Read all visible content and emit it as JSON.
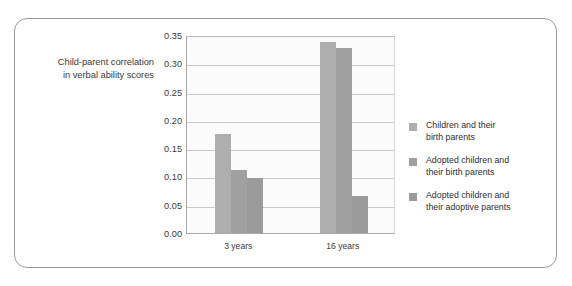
{
  "figure": {
    "background": "#ffffff",
    "frame_color": "#9a9a9a"
  },
  "chart_data": {
    "type": "bar",
    "title": "",
    "xlabel": "",
    "ylabel": "Child-parent correlation in verbal ability scores",
    "ylabel_line1": "Child-parent correlation",
    "ylabel_line2": "in verbal ability scores",
    "categories": [
      "3 years",
      "16 years"
    ],
    "ylim": [
      0.0,
      0.35
    ],
    "ytick_labels": [
      "0.35",
      "0.30",
      "0.25",
      "0.20",
      "0.15",
      "0.10",
      "0.05",
      "0.00"
    ],
    "ytick_values": [
      0.35,
      0.3,
      0.25,
      0.2,
      0.15,
      0.1,
      0.05,
      0.0
    ],
    "grid": true,
    "grid_axis": "y",
    "legend_position": "right",
    "series": [
      {
        "name": "Children and their birth parents",
        "name_line1": "Children and their",
        "name_line2": "birth parents",
        "color": "#aeaeae",
        "values": [
          0.175,
          0.338
        ]
      },
      {
        "name": "Adopted children and their birth parents",
        "name_line1": "Adopted children and",
        "name_line2": "their birth parents",
        "color": "#a0a0a0",
        "values": [
          0.112,
          0.327
        ]
      },
      {
        "name": "Adopted children and their adoptive parents",
        "name_line1": "Adopted children and",
        "name_line2": "their adoptive parents",
        "color": "#9b9b9b",
        "values": [
          0.097,
          0.065
        ]
      }
    ]
  }
}
